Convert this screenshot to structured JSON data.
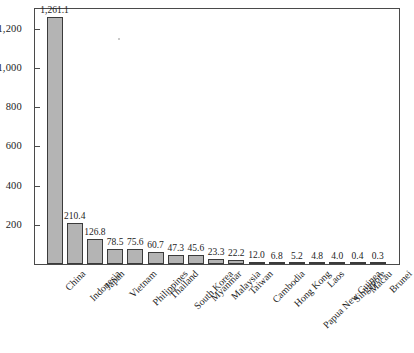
{
  "chart_data": {
    "type": "bar",
    "title": "",
    "subtitle": "",
    "xlabel": "",
    "ylabel": "",
    "ylim": [
      0,
      1300
    ],
    "grid": false,
    "legend": null,
    "y_ticks": [
      "200",
      "400",
      "600",
      "800",
      "1,000",
      "1,200"
    ],
    "y_tick_values": [
      200,
      400,
      600,
      800,
      1000,
      1200
    ],
    "categories": [
      "China",
      "Indonesia",
      "Japan",
      "Vietnam",
      "Philippines",
      "Thailand",
      "South Korea",
      "Myanmar",
      "Malaysia",
      "Taiwan",
      "Cambodia",
      "Hong Kong",
      "Papua New Guinea",
      "Laos",
      "Singapore",
      "Macau",
      "Brunei"
    ],
    "values": [
      1261.1,
      210.4,
      126.8,
      78.5,
      75.6,
      60.7,
      47.3,
      45.6,
      23.3,
      22.2,
      12.0,
      6.8,
      5.2,
      4.8,
      4.0,
      0.4,
      0.3
    ],
    "value_labels": [
      "1,261.1",
      "210.4",
      "126.8",
      "78.5",
      "75.6",
      "60.7",
      "47.3",
      "45.6",
      "23.3",
      "22.2",
      "12.0",
      "6.8",
      "5.2",
      "4.8",
      "4.0",
      "0.4",
      "0.3"
    ],
    "colors": {
      "bar_fill": "#b4b4b4",
      "bar_edge": "#3b3b3b",
      "axis": "#4a4a4a",
      "text": "#1c1c1c",
      "background": "#ffffff"
    }
  }
}
